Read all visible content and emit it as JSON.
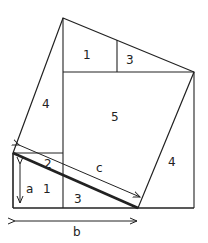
{
  "diagram": {
    "type": "pythagorean-dissection-proof",
    "labels": {
      "region_1_top": "1",
      "region_3_top": "3",
      "region_4_left": "4",
      "region_5_center": "5",
      "region_4_right": "4",
      "region_2_strip": "2",
      "region_1_bottom": "1",
      "region_3_bottom": "3",
      "side_a": "a",
      "side_b": "b",
      "side_c": "c"
    },
    "colors": {
      "stroke": "#222222",
      "background": "#ffffff"
    }
  }
}
